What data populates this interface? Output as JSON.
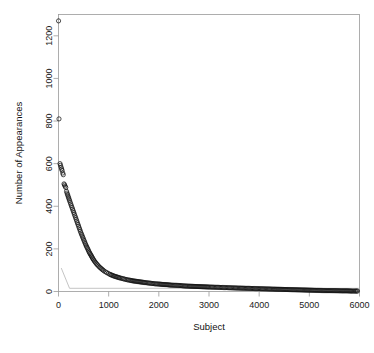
{
  "chart_data": {
    "type": "scatter",
    "title": "",
    "xlabel": "Subject",
    "ylabel": "Number of Appearances",
    "xlim": [
      0,
      6000
    ],
    "ylim": [
      0,
      1300
    ],
    "grid": false,
    "legend": null,
    "marker": "open-circle",
    "xticks": [
      0,
      1000,
      2000,
      3000,
      4000,
      5000,
      6000
    ],
    "xtick_labels": [
      "0",
      "1000",
      "2000",
      "3000",
      "4000",
      "5000",
      "6000"
    ],
    "yticks": [
      0,
      200,
      400,
      600,
      800,
      1000,
      1200
    ],
    "ytick_labels": [
      "0",
      "200",
      "400",
      "600",
      "800",
      "1000",
      "1200"
    ],
    "annotations": [
      {
        "label": "top outlier",
        "x": 1,
        "y": 1270
      },
      {
        "label": "second outlier",
        "x": 10,
        "y": 810
      }
    ],
    "series": [
      {
        "name": "appearances",
        "points": [
          [
            1,
            1270
          ],
          [
            10,
            810
          ],
          [
            30,
            600
          ],
          [
            40,
            592
          ],
          [
            52,
            583
          ],
          [
            62,
            575
          ],
          [
            72,
            568
          ],
          [
            85,
            556
          ],
          [
            95,
            548
          ],
          [
            110,
            505
          ],
          [
            120,
            500
          ],
          [
            132,
            494
          ],
          [
            145,
            488
          ],
          [
            160,
            470
          ],
          [
            170,
            462
          ],
          [
            180,
            455
          ],
          [
            190,
            448
          ],
          [
            200,
            441
          ],
          [
            210,
            434
          ],
          [
            220,
            427
          ],
          [
            232,
            419
          ],
          [
            244,
            411
          ],
          [
            256,
            403
          ],
          [
            268,
            395
          ],
          [
            280,
            387
          ],
          [
            292,
            379
          ],
          [
            304,
            371
          ],
          [
            316,
            363
          ],
          [
            328,
            355
          ],
          [
            340,
            347
          ],
          [
            352,
            339
          ],
          [
            364,
            331
          ],
          [
            376,
            323
          ],
          [
            388,
            315
          ],
          [
            400,
            307
          ],
          [
            412,
            299
          ],
          [
            424,
            291
          ],
          [
            436,
            283
          ],
          [
            448,
            275
          ],
          [
            460,
            268
          ],
          [
            472,
            261
          ],
          [
            484,
            254
          ],
          [
            496,
            247
          ],
          [
            508,
            240
          ],
          [
            520,
            233
          ],
          [
            532,
            226
          ],
          [
            544,
            219
          ],
          [
            556,
            213
          ],
          [
            568,
            207
          ],
          [
            580,
            201
          ],
          [
            592,
            195
          ],
          [
            604,
            189
          ],
          [
            616,
            183
          ],
          [
            628,
            178
          ],
          [
            640,
            173
          ],
          [
            652,
            168
          ],
          [
            664,
            163
          ],
          [
            676,
            158
          ],
          [
            688,
            153
          ],
          [
            700,
            148
          ],
          [
            716,
            143
          ],
          [
            732,
            138
          ],
          [
            748,
            133
          ],
          [
            764,
            128
          ],
          [
            780,
            124
          ],
          [
            800,
            119
          ],
          [
            820,
            114
          ],
          [
            840,
            110
          ],
          [
            860,
            106
          ],
          [
            880,
            102
          ],
          [
            900,
            98
          ],
          [
            930,
            93
          ],
          [
            960,
            89
          ],
          [
            990,
            85
          ],
          [
            1020,
            81
          ],
          [
            1060,
            77
          ],
          [
            1100,
            73
          ],
          [
            1140,
            70
          ],
          [
            1180,
            67
          ],
          [
            1220,
            64
          ],
          [
            1270,
            61
          ],
          [
            1320,
            58
          ],
          [
            1370,
            55
          ],
          [
            1420,
            53
          ],
          [
            1480,
            50
          ],
          [
            1540,
            48
          ],
          [
            1600,
            46
          ],
          [
            1660,
            44
          ],
          [
            1720,
            42
          ],
          [
            1790,
            40
          ],
          [
            1860,
            38
          ],
          [
            1930,
            36
          ],
          [
            2000,
            35
          ],
          [
            2080,
            33
          ],
          [
            2160,
            32
          ],
          [
            2240,
            30
          ],
          [
            2330,
            29
          ],
          [
            2420,
            28
          ],
          [
            2510,
            26
          ],
          [
            2600,
            25
          ],
          [
            2700,
            24
          ],
          [
            2800,
            23
          ],
          [
            2900,
            22
          ],
          [
            3000,
            21
          ],
          [
            3120,
            20
          ],
          [
            3240,
            19
          ],
          [
            3360,
            18
          ],
          [
            3480,
            17
          ],
          [
            3600,
            16
          ],
          [
            3740,
            15
          ],
          [
            3880,
            14
          ],
          [
            4020,
            13
          ],
          [
            4160,
            12
          ],
          [
            4300,
            11
          ],
          [
            4450,
            10
          ],
          [
            4600,
            9
          ],
          [
            4750,
            8
          ],
          [
            4900,
            7
          ],
          [
            5050,
            6
          ],
          [
            5200,
            5
          ],
          [
            5350,
            4
          ],
          [
            5500,
            4
          ],
          [
            5650,
            3
          ],
          [
            5750,
            3
          ],
          [
            5850,
            2
          ],
          [
            5920,
            2
          ],
          [
            5960,
            2
          ]
        ]
      }
    ],
    "reference_line": {
      "name": "fitted-reference-line",
      "points": [
        [
          55,
          110
        ],
        [
          220,
          15
        ],
        [
          6000,
          15
        ]
      ]
    }
  }
}
